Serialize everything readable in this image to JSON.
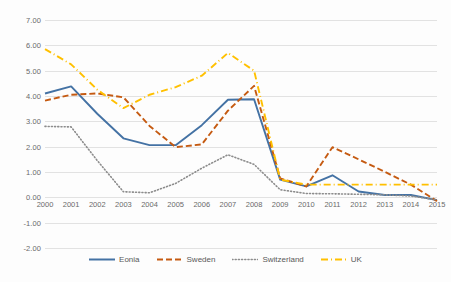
{
  "chart_data": {
    "type": "line",
    "title": "",
    "subtitle": "",
    "xlabel": "",
    "ylabel": "",
    "grid": true,
    "legend_position": "bottom",
    "xlim": [
      2000,
      2015
    ],
    "ylim": [
      -2.0,
      7.0
    ],
    "ytick_step": 1.0,
    "categories": [
      "2000",
      "2001",
      "2002",
      "2003",
      "2004",
      "2005",
      "2006",
      "2007",
      "2008",
      "2009",
      "2010",
      "2011",
      "2012",
      "2013",
      "2014",
      "2015"
    ],
    "ytick_labels": [
      "7.00",
      "6.00",
      "5.00",
      "4.00",
      "3.00",
      "2.00",
      "1.00",
      "0.00",
      "-1.00",
      "-2.00"
    ],
    "ytick_values": [
      7.0,
      6.0,
      5.0,
      4.0,
      3.0,
      2.0,
      1.0,
      0.0,
      -1.0,
      -2.0
    ],
    "series": [
      {
        "name": "Eonia",
        "color": "#4472A4",
        "style": "solid",
        "values": [
          4.1,
          4.38,
          3.3,
          2.33,
          2.06,
          2.06,
          2.85,
          3.85,
          3.87,
          0.7,
          0.43,
          0.87,
          0.23,
          0.09,
          0.09,
          -0.11
        ]
      },
      {
        "name": "Sweden",
        "color": "#C55A11",
        "style": "dashed",
        "values": [
          3.82,
          4.05,
          4.1,
          3.95,
          2.82,
          1.98,
          2.09,
          3.42,
          4.4,
          0.75,
          0.43,
          1.98,
          1.5,
          1.01,
          0.5,
          -0.15
        ]
      },
      {
        "name": "Switzerland",
        "color": "#8C8C8C",
        "style": "dotted",
        "values": [
          2.8,
          2.78,
          1.45,
          0.22,
          0.18,
          0.55,
          1.15,
          1.68,
          1.3,
          0.3,
          0.15,
          0.14,
          0.12,
          0.1,
          0.05,
          -0.1
        ]
      },
      {
        "name": "UK",
        "color": "#FFC000",
        "style": "dashdot",
        "values": [
          5.85,
          5.25,
          4.25,
          3.52,
          4.05,
          4.35,
          4.8,
          5.7,
          5.0,
          0.7,
          0.5,
          0.5,
          0.5,
          0.5,
          0.5,
          0.5
        ]
      }
    ]
  },
  "legend": {
    "items": [
      {
        "label": "Eonia"
      },
      {
        "label": "Sweden"
      },
      {
        "label": "Switzerland"
      },
      {
        "label": "UK"
      }
    ]
  }
}
